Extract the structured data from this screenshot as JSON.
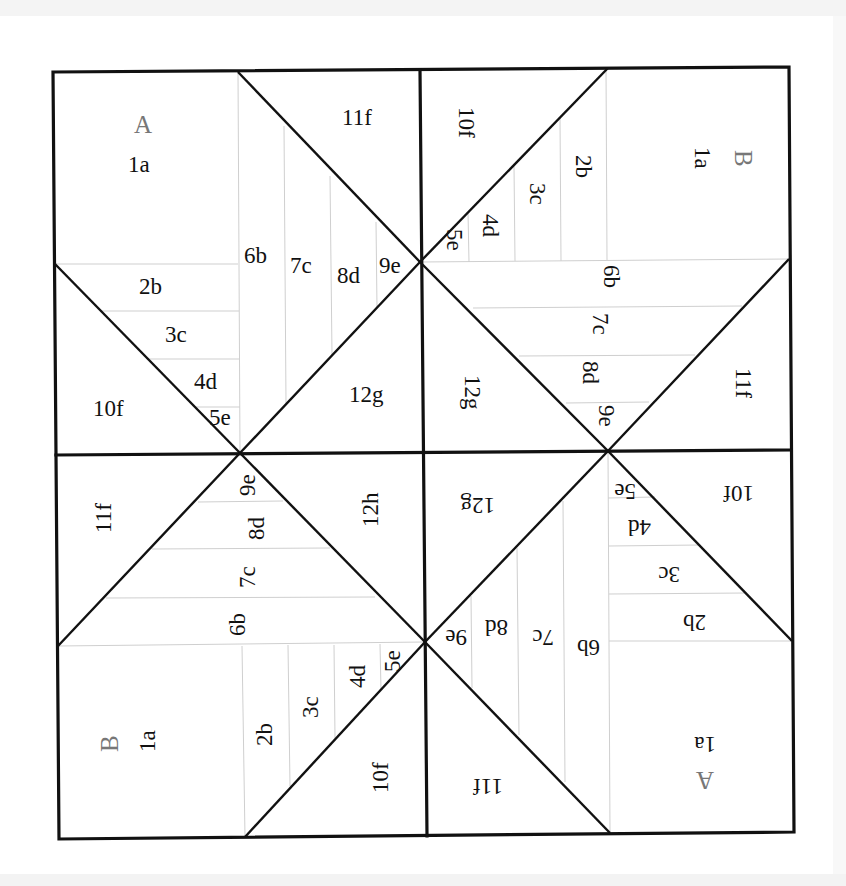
{
  "diagram": {
    "type": "foundation-paper-piecing-pattern",
    "grid": "2x2 blocks, each divided by two diagonals into triangle sections",
    "line_color": "#111111",
    "seam_color": "#cfcfcf",
    "section_label_color": "#777777"
  },
  "blocks": {
    "top_left": {
      "section_letter": "A",
      "labels": [
        "1a",
        "2b",
        "3c",
        "4d",
        "5e",
        "6b",
        "7c",
        "8d",
        "9e",
        "10f",
        "11f",
        "12g"
      ]
    },
    "top_right": {
      "section_letter": "B",
      "labels": [
        "1a",
        "2b",
        "3c",
        "4d",
        "5e",
        "6b",
        "7c",
        "8d",
        "9e",
        "10f",
        "11f",
        "12g"
      ]
    },
    "bottom_left": {
      "section_letter": "B",
      "labels": [
        "1a",
        "2b",
        "3c",
        "4d",
        "5e",
        "6b",
        "7c",
        "8d",
        "9e",
        "10f",
        "11f",
        "12h"
      ]
    },
    "bottom_right": {
      "section_letter": "A",
      "labels": [
        "1a",
        "2b",
        "3c",
        "4d",
        "5e",
        "6b",
        "7c",
        "8d",
        "9e",
        "10f",
        "11f",
        "12g"
      ]
    }
  }
}
